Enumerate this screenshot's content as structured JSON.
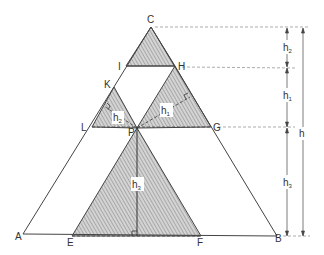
{
  "diagram": {
    "type": "geometry",
    "colors": {
      "stroke": "#444444",
      "hatch": "#8a8a8a",
      "fill": "#d4d4d4",
      "dashed": "#888888"
    },
    "points": {
      "C": {
        "label": "C",
        "x": 151,
        "y": 27
      },
      "A": {
        "label": "A",
        "x": 23,
        "y": 234
      },
      "B": {
        "label": "B",
        "x": 277,
        "y": 236
      },
      "I": {
        "label": "I",
        "x": 126,
        "y": 66
      },
      "H": {
        "label": "H",
        "x": 175,
        "y": 66
      },
      "K": {
        "label": "K",
        "x": 114,
        "y": 87
      },
      "L": {
        "label": "L",
        "x": 92,
        "y": 127
      },
      "P": {
        "label": "P",
        "x": 137,
        "y": 128
      },
      "G": {
        "label": "G",
        "x": 211,
        "y": 127
      },
      "E": {
        "label": "E",
        "x": 72,
        "y": 236
      },
      "F": {
        "label": "F",
        "x": 201,
        "y": 236
      }
    },
    "heights": {
      "h1": {
        "label": "h",
        "sub": "1"
      },
      "h2": {
        "label": "h",
        "sub": "2"
      },
      "h3": {
        "label": "h",
        "sub": "3"
      },
      "h": {
        "label": "h"
      }
    },
    "dimension_labels": {
      "h2": {
        "label": "h",
        "sub": "2"
      },
      "h1": {
        "label": "h",
        "sub": "1"
      },
      "h3": {
        "label": "h",
        "sub": "3"
      },
      "h": {
        "label": "h"
      }
    }
  }
}
